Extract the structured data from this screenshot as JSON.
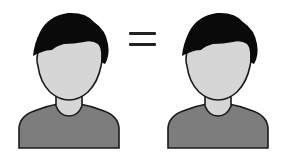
{
  "scene": {
    "left_figure": {
      "label": "Person avatar (left)",
      "icon": "person-avatar-icon"
    },
    "operator": {
      "symbol": "=",
      "icon": "equals-icon"
    },
    "right_figure": {
      "label": "Person avatar (right)",
      "icon": "person-avatar-icon"
    }
  },
  "colors": {
    "hair": "#0a0a0a",
    "skin": "#d6d6d6",
    "shirt": "#7d7d7d",
    "outline": "#1a1a1a",
    "background": "#ffffff"
  }
}
